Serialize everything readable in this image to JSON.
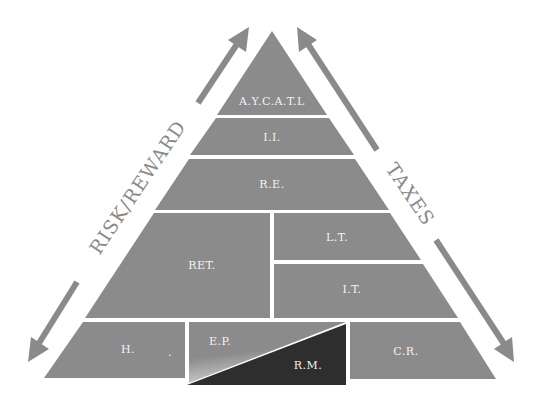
{
  "diagram": {
    "type": "pyramid",
    "colors": {
      "block": "#8b8b8b",
      "dark_block": "#2e2e2e",
      "separator": "#ffffff",
      "label": "#f2f2f2",
      "arrow": "#8a8a8a"
    },
    "side_labels": {
      "left": "RISK/REWARD",
      "right": "TAXES"
    },
    "tiers": [
      {
        "level": 1,
        "blocks": [
          {
            "label": "A.Y.C.A.T.L"
          }
        ]
      },
      {
        "level": 2,
        "blocks": [
          {
            "label": "I.I."
          }
        ]
      },
      {
        "level": 3,
        "blocks": [
          {
            "label": "R.E."
          }
        ]
      },
      {
        "level": 4,
        "blocks": [
          {
            "label": "RET."
          },
          {
            "label": "L.T."
          },
          {
            "label": "I.T."
          }
        ]
      },
      {
        "level": 5,
        "blocks": [
          {
            "label": "H."
          },
          {
            "label": "E.P."
          },
          {
            "label": "R.M."
          },
          {
            "label": "C.R."
          }
        ]
      }
    ],
    "labels": {
      "aycatl": "A.Y.C.A.T.L",
      "ii": "I.I.",
      "re": "R.E.",
      "ret": "RET.",
      "lt": "L.T.",
      "it": "I.T.",
      "h": "H.",
      "h_dot": ".",
      "ep": "E.P.",
      "rm": "R.M.",
      "cr": "C.R."
    }
  }
}
